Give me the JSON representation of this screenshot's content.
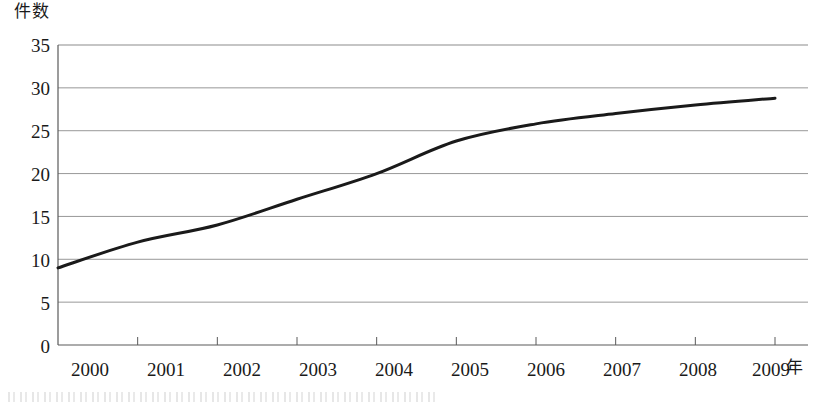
{
  "chart_data": {
    "type": "line",
    "title": "",
    "xlabel": "年",
    "ylabel": "件数",
    "categories": [
      "2000",
      "2001",
      "2002",
      "2003",
      "2004",
      "2005",
      "2006",
      "2007",
      "2008",
      "2009"
    ],
    "x": [
      2000,
      2001,
      2002,
      2003,
      2004,
      2005,
      2006,
      2007,
      2008,
      2009
    ],
    "values": [
      9,
      12,
      14,
      17,
      20,
      23.8,
      25.8,
      27,
      28,
      28.8
    ],
    "series": [
      {
        "name": "件数",
        "values": [
          9,
          12,
          14,
          17,
          20,
          23.8,
          25.8,
          27,
          28,
          28.8
        ],
        "color": "#1a1a1a"
      }
    ],
    "ylim": [
      0,
      35
    ],
    "yticks": [
      0,
      5,
      10,
      15,
      20,
      25,
      30,
      35
    ],
    "ytick_labels": [
      "0",
      "5",
      "10",
      "15",
      "20",
      "25",
      "30",
      "35"
    ],
    "xlim": [
      2000,
      2009
    ],
    "grid": true,
    "grid_axis": "y",
    "grid_color": "#8c8c8c",
    "legend": false,
    "legend_position": "none",
    "line_color": "#1a1a1a",
    "line_width": 3,
    "markers": false,
    "axis_color": "#5a5a5a",
    "background": "#ffffff"
  },
  "labels": {
    "y_axis_title": "件数",
    "x_axis_title": "年"
  }
}
